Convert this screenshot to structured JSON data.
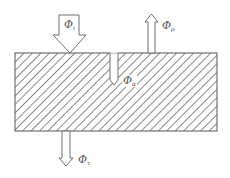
{
  "diagram": {
    "type": "radiant-flux-balance",
    "colors": {
      "stroke": "#6e6e6e",
      "hatch": "#8a8a8a",
      "background": "#ffffff"
    },
    "body": {
      "shape": "rectangle",
      "fill": "diagonal-hatch"
    },
    "labels": {
      "incident": {
        "symbol": "Φ",
        "subscript": "i"
      },
      "reflected": {
        "symbol": "Φ",
        "subscript": "ρ"
      },
      "absorbed": {
        "symbol": "Φ",
        "subscript": "α"
      },
      "transmitted": {
        "symbol": "Φ",
        "subscript": "τ"
      }
    },
    "arrows": [
      {
        "name": "incident",
        "direction": "down",
        "style": "wide-hollow"
      },
      {
        "name": "reflected",
        "direction": "up",
        "style": "narrow-hollow"
      },
      {
        "name": "absorbed",
        "direction": "down",
        "style": "narrow-internal"
      },
      {
        "name": "transmitted",
        "direction": "down",
        "style": "narrow-hollow"
      }
    ]
  }
}
